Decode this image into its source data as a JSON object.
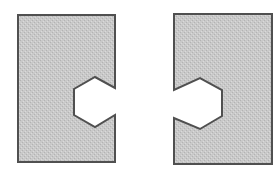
{
  "figure": {
    "colors": {
      "background": "#ffffff",
      "fill": "#c9c9c9",
      "fill_dot": "#b3b3b3",
      "fill_light": "#dadada",
      "stroke": "#505050",
      "notch_fill": "#ffffff"
    },
    "shapes": [
      {
        "name": "left-piece",
        "points": "18,15 115,15 115,88 95,77 74,89 74,115 95,127 115,115 115,162 18,162"
      },
      {
        "name": "right-piece",
        "points": "174,14 272,14 272,164 174,164 174,118 200,129 222,116 222,90 200,78 174,90"
      }
    ]
  }
}
